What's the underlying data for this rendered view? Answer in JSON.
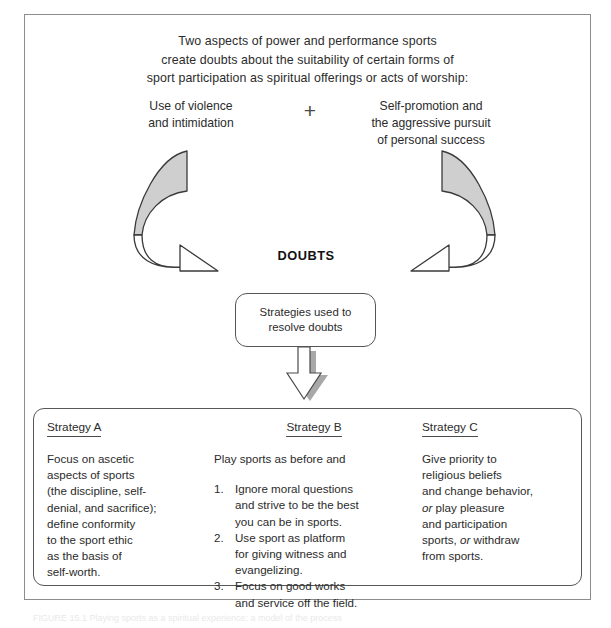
{
  "heading": {
    "lines": [
      "Two aspects of power and performance sports",
      "create doubts about the suitability of certain forms of",
      "sport participation as spiritual offerings or acts of worship:"
    ]
  },
  "aspects": {
    "left": {
      "label": "use-of-violence",
      "lines": [
        "Use of violence",
        "and intimidation"
      ]
    },
    "right": {
      "label": "self-promotion",
      "lines": [
        "Self-promotion and",
        "the aggressive pursuit",
        "of personal success"
      ]
    },
    "operator": "+"
  },
  "center": {
    "doubts_label": "DOUBTS",
    "strategies_node_lines": [
      "Strategies used to",
      "resolve doubts"
    ]
  },
  "panel": {
    "columns": [
      {
        "id": "strategy-a",
        "title": "Strategy A",
        "lines": [
          "Focus on ascetic",
          "aspects of sports",
          "(the discipline, self-",
          "denial, and sacrifice);",
          "define conformity",
          "to the sport ethic",
          "as the basis of",
          "self-worth."
        ]
      },
      {
        "id": "strategy-b",
        "title": "Strategy B",
        "lead": "Play sports as before and",
        "items": [
          {
            "number": "1.",
            "lines": [
              "Ignore moral questions",
              "and strive to be the best",
              "you can be in sports."
            ]
          },
          {
            "number": "2.",
            "lines": [
              "Use sport as platform",
              "for giving witness and",
              "evangelizing."
            ]
          },
          {
            "number": "3.",
            "lines": [
              "Focus on good works",
              "and service off the field."
            ]
          }
        ]
      },
      {
        "id": "strategy-c",
        "title": "Strategy C",
        "lines": [
          "Give priority to",
          "religious beliefs",
          "and change behavior,",
          "or play pleasure",
          "and participation",
          "sports, or withdraw",
          "from sports."
        ],
        "italic_words": [
          "or",
          "or"
        ]
      }
    ]
  },
  "caption": {
    "text": "FIGURE 15.1  Playing sports as a spiritual experience: a model of the process"
  },
  "colors": {
    "frame": "#8d8d8d",
    "ink": "#2b2b2b",
    "arrow_fill_gray": "#cfcfcf",
    "arrow_stroke": "#3a3a3a",
    "shadow_gray": "#9a9a9a"
  }
}
